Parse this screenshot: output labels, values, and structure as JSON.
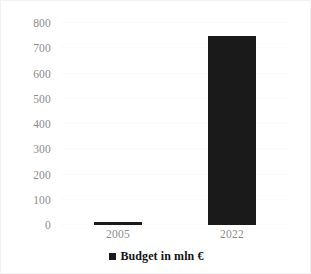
{
  "chart_data": {
    "type": "bar",
    "title": "",
    "subtitle": "",
    "xlabel": "",
    "ylabel": "",
    "categories": [
      "2005",
      "2022"
    ],
    "series": [
      {
        "name": "Budget in mln €",
        "values": [
          10,
          750
        ],
        "color": "#1a1a1a"
      }
    ],
    "ylim": [
      0,
      800
    ],
    "yticks": [
      0,
      100,
      200,
      300,
      400,
      500,
      600,
      700,
      800
    ],
    "ytick_labels": [
      "0",
      "100",
      "200",
      "300",
      "400",
      "500",
      "600",
      "700",
      "800"
    ],
    "grid": true,
    "grid_color": "#fbfbfb",
    "legend": {
      "position": "bottom",
      "entries": [
        {
          "label": "Budget in mln €",
          "marker": "filled-square",
          "color": "#1a1a1a"
        }
      ]
    },
    "axis_label_color": "#8c8c8c",
    "background_color": "#ffffff"
  }
}
